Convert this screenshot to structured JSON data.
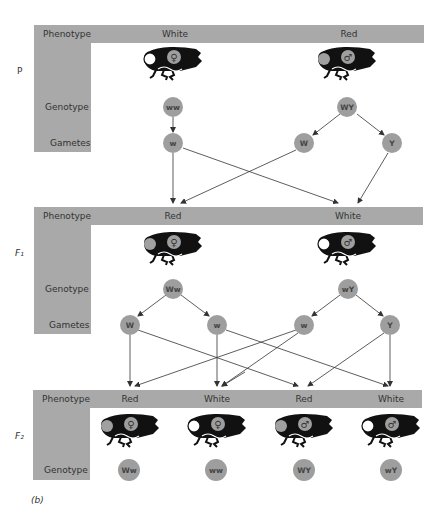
{
  "figure_label": "(b)",
  "row_labels": {
    "phenotype": "Phenotype",
    "genotype": "Genotype",
    "gametes": "Gametes"
  },
  "generations": [
    {
      "id": "P",
      "label": "P",
      "phenotypes": [
        "White",
        "Red"
      ],
      "flies": [
        {
          "sex": "female",
          "symbol": "♀",
          "eye": "white"
        },
        {
          "sex": "male",
          "symbol": "♂",
          "eye": "red"
        }
      ],
      "genotypes": [
        "ww",
        "WY"
      ],
      "gametes": [
        "w",
        "W",
        "Y"
      ]
    },
    {
      "id": "F1",
      "label": "F₁",
      "phenotypes": [
        "Red",
        "White"
      ],
      "flies": [
        {
          "sex": "female",
          "symbol": "♀",
          "eye": "red"
        },
        {
          "sex": "male",
          "symbol": "♂",
          "eye": "white"
        }
      ],
      "genotypes": [
        "Ww",
        "wY"
      ],
      "gametes": [
        "W",
        "w",
        "w",
        "Y"
      ]
    },
    {
      "id": "F2",
      "label": "F₂",
      "phenotypes": [
        "Red",
        "White",
        "Red",
        "White"
      ],
      "flies": [
        {
          "sex": "female",
          "symbol": "♀",
          "eye": "red"
        },
        {
          "sex": "female",
          "symbol": "♀",
          "eye": "white"
        },
        {
          "sex": "male",
          "symbol": "♂",
          "eye": "red"
        },
        {
          "sex": "male",
          "symbol": "♂",
          "eye": "white"
        }
      ],
      "genotypes": [
        "Ww",
        "ww",
        "WY",
        "wY"
      ]
    }
  ],
  "colors": {
    "bar": "#a9a9a9",
    "circle": "#9e9e9e",
    "fly": "#111111",
    "red_eye": "#a0a0a0",
    "white_eye": "#ffffff"
  }
}
